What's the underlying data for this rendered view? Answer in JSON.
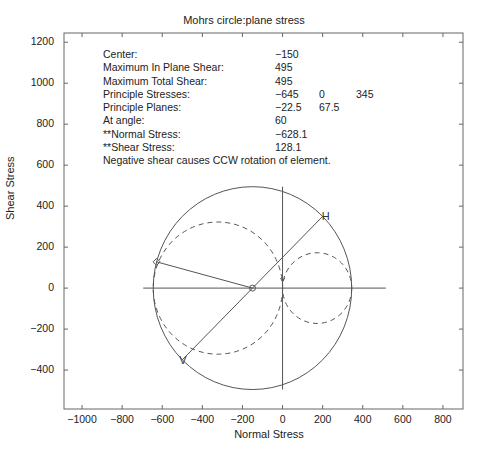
{
  "chart_data": {
    "type": "scatter",
    "title": "Mohrs circle:plane stress",
    "xlabel": "Normal Stress",
    "ylabel": "Shear Stress",
    "xlim": [
      -1090,
      900
    ],
    "ylim": [
      -590,
      1245
    ],
    "grid": false,
    "xticks": [
      -1000,
      -800,
      -600,
      -400,
      -200,
      0,
      200,
      400,
      600,
      800
    ],
    "yticks": [
      -400,
      -200,
      0,
      200,
      400,
      600,
      800,
      1000,
      1200
    ],
    "xtick_labels": [
      "−1000",
      "−800",
      "−600",
      "−400",
      "−200",
      "0",
      "200",
      "400",
      "600",
      "800"
    ],
    "ytick_labels": [
      "−400",
      "−200",
      "0",
      "200",
      "400",
      "600",
      "800",
      "1000",
      "1200"
    ],
    "circles": [
      {
        "name": "total",
        "center": [
          -150,
          0
        ],
        "radius": 495,
        "style": "solid"
      },
      {
        "name": "sigma1-sigma2",
        "center": [
          -322.5,
          0
        ],
        "radius": 322.5,
        "style": "dashed"
      },
      {
        "name": "sigma2-sigma3",
        "center": [
          172.5,
          0
        ],
        "radius": 172.5,
        "style": "dashed"
      }
    ],
    "lines": [
      {
        "name": "normal-axis",
        "x": [
          -695,
          515
        ],
        "y": [
          0,
          0
        ]
      },
      {
        "name": "shear-axis",
        "x": [
          0,
          0
        ],
        "y": [
          495,
          -495
        ]
      },
      {
        "name": "H-V diameter",
        "x": [
          200,
          -500
        ],
        "y": [
          350,
          -350
        ]
      },
      {
        "name": "angle-radius",
        "x": [
          -150,
          -628.1
        ],
        "y": [
          0,
          128.1
        ]
      }
    ],
    "points": [
      {
        "label": "H",
        "x": 200,
        "y": 350,
        "marker": "x"
      },
      {
        "label": "V",
        "x": -500,
        "y": -350,
        "marker": "v"
      },
      {
        "label": "center",
        "x": -150,
        "y": 0,
        "marker": "o"
      },
      {
        "label": "at angle",
        "x": -628.1,
        "y": 128.1,
        "marker": "diamond"
      }
    ],
    "annotations": {
      "center": -150,
      "max_in_plane_shear": 495,
      "max_total_shear": 495,
      "principal_stresses": [
        -645,
        0,
        345
      ],
      "principal_planes": [
        -22.5,
        67.5
      ],
      "at_angle": 60,
      "normal_stress": -628.1,
      "shear_stress": 128.1
    }
  },
  "info": [
    {
      "label": "Center:",
      "values": [
        "−150"
      ]
    },
    {
      "label": "Maximum In Plane Shear:",
      "values": [
        "495"
      ]
    },
    {
      "label": "Maximum Total Shear:",
      "values": [
        "495"
      ]
    },
    {
      "label": "Principle Stresses:",
      "values": [
        "−645",
        "0",
        "345"
      ]
    },
    {
      "label": "Principle Planes:",
      "values": [
        "−22.5",
        "67.5"
      ]
    },
    {
      "label": "At angle:",
      "values": [
        "60"
      ]
    },
    {
      "label": "**Normal Stress:",
      "values": [
        "−628.1"
      ]
    },
    {
      "label": "**Shear Stress:",
      "values": [
        "128.1"
      ]
    },
    {
      "label": "Negative shear causes CCW rotation of element.",
      "values": []
    }
  ],
  "markers": {
    "h_label": "H",
    "v_label": "V"
  },
  "colors": {
    "line": "#555555",
    "axis": "#666666",
    "text": "#222222"
  }
}
